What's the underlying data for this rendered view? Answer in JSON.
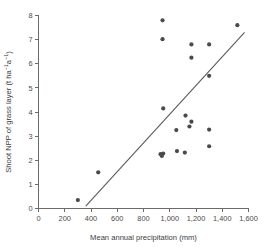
{
  "chart_data": {
    "type": "scatter",
    "title": "",
    "xlabel": "Mean annual precipitation (mm)",
    "ylabel_main": "Shoot NPP of grass layer (t ha",
    "ylabel_sup1": "−1",
    "ylabel_mid": "a",
    "ylabel_sup2": "−1",
    "ylabel_close": ")",
    "ylabel_plain": "Shoot NPP of grass layer (t ha−1a−1)",
    "xlim": [
      0,
      1600
    ],
    "ylim": [
      0,
      8
    ],
    "xticks": [
      0,
      200,
      400,
      600,
      800,
      1000,
      1200,
      1400,
      1600
    ],
    "xtick_labels": [
      "0",
      "200",
      "400",
      "600",
      "800",
      "1,000",
      "1,200",
      "1,400",
      "1,600"
    ],
    "yticks": [
      0,
      1,
      2,
      3,
      4,
      5,
      6,
      7,
      8
    ],
    "ytick_labels": [
      "0",
      "1",
      "2",
      "3",
      "4",
      "5",
      "6",
      "7",
      "8"
    ],
    "grid": false,
    "legend": false,
    "marker_color": "#4a4a4a",
    "line_color": "#5a5a5a",
    "axis_color": "#6b6b6b",
    "x": [
      300,
      455,
      930,
      940,
      950,
      945,
      945,
      950,
      1050,
      1055,
      1115,
      1120,
      1150,
      1165,
      1165,
      1300,
      1300,
      1300,
      1300,
      1515
    ],
    "y": [
      0.35,
      1.5,
      2.25,
      2.18,
      2.28,
      7.8,
      7.02,
      4.15,
      3.25,
      2.38,
      2.32,
      3.85,
      3.4,
      3.6,
      6.25,
      6.8,
      5.5,
      3.27,
      2.58,
      7.6
    ],
    "points": [
      {
        "x": 300,
        "y": 0.35
      },
      {
        "x": 455,
        "y": 1.5
      },
      {
        "x": 930,
        "y": 2.25
      },
      {
        "x": 940,
        "y": 2.18
      },
      {
        "x": 950,
        "y": 2.28
      },
      {
        "x": 945,
        "y": 7.8
      },
      {
        "x": 945,
        "y": 7.02
      },
      {
        "x": 950,
        "y": 4.15
      },
      {
        "x": 1050,
        "y": 3.25
      },
      {
        "x": 1055,
        "y": 2.38
      },
      {
        "x": 1115,
        "y": 2.32
      },
      {
        "x": 1120,
        "y": 3.85
      },
      {
        "x": 1150,
        "y": 3.4
      },
      {
        "x": 1165,
        "y": 3.6
      },
      {
        "x": 1165,
        "y": 6.25
      },
      {
        "x": 1300,
        "y": 6.8
      },
      {
        "x": 1300,
        "y": 5.5
      },
      {
        "x": 1300,
        "y": 3.27
      },
      {
        "x": 1300,
        "y": 2.58
      },
      {
        "x": 1515,
        "y": 7.6
      },
      {
        "x": 1165,
        "y": 6.8
      }
    ],
    "trendline": {
      "x1": 360,
      "y1": 0.1,
      "x2": 1570,
      "y2": 7.3
    }
  }
}
